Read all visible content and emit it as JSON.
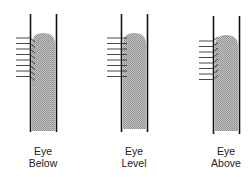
{
  "diagram": {
    "title": "",
    "panels": [
      {
        "id": "below",
        "line1": "Eye",
        "line2": "Below",
        "sight": "down"
      },
      {
        "id": "level",
        "line1": "Eye",
        "line2": "Level",
        "sight": "flat"
      },
      {
        "id": "above",
        "line1": "Eye",
        "line2": "Above",
        "sight": "up"
      }
    ]
  },
  "colors": {
    "wall": "#111111",
    "liquid": "#a8a8a8",
    "lines": "#333333"
  }
}
